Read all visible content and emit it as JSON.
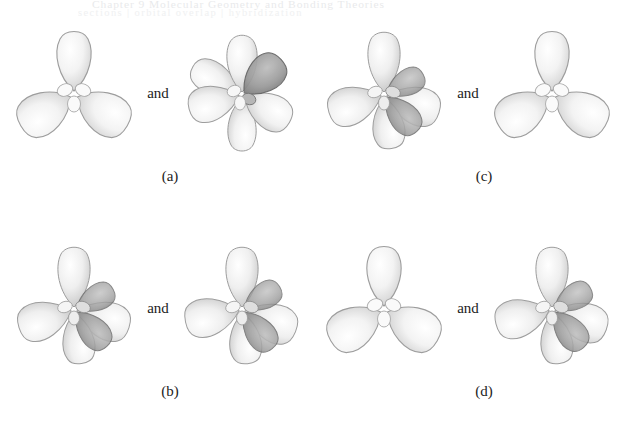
{
  "figure": {
    "background_color": "#ffffff",
    "ghost_header": {
      "line1": "Chapter 9   Molecular Geometry and Bonding Theories",
      "line2": "sections  |  orbital overlap  |  hybridization"
    },
    "conjunction_label": "and",
    "panels": [
      {
        "id": "a",
        "label": "(a)",
        "position": "top-left",
        "left": {
          "name": "three-lobe-orbital",
          "lobe_count": 3,
          "lobe_angles_deg": [
            90,
            210,
            330
          ],
          "shaded": false,
          "description": "three-lobed orbital, lobes up, lower-left, lower-right"
        },
        "right": {
          "name": "multi-lobe-orbital-shaded",
          "lobe_count": 6,
          "lobe_angles_deg": [
            90,
            150,
            210,
            270,
            330,
            45
          ],
          "shaded": true,
          "description": "six-lobed orbital with a dark shaded lobe pointing upper-right"
        }
      },
      {
        "id": "b",
        "label": "(b)",
        "position": "bottom-left",
        "left": {
          "name": "multi-lobe-orbital-shaded",
          "lobe_count": 6,
          "lobe_angles_deg": [
            90,
            150,
            210,
            270,
            330,
            30
          ],
          "shaded": true,
          "description": "six-lobed orbital with dark shaded lobes lower-right"
        },
        "right": {
          "name": "multi-lobe-orbital-shaded",
          "lobe_count": 6,
          "lobe_angles_deg": [
            90,
            150,
            210,
            270,
            330,
            30
          ],
          "shaded": true,
          "description": "six-lobed orbital with dark shaded lobes lower-right"
        }
      },
      {
        "id": "c",
        "label": "(c)",
        "position": "top-right",
        "left": {
          "name": "multi-lobe-orbital-shaded",
          "lobe_count": 6,
          "lobe_angles_deg": [
            90,
            150,
            210,
            270,
            330,
            30
          ],
          "shaded": true,
          "description": "six-lobed orbital with dark shaded lobes lower-right"
        },
        "right": {
          "name": "three-lobe-orbital",
          "lobe_count": 3,
          "lobe_angles_deg": [
            90,
            210,
            330
          ],
          "shaded": false,
          "description": "three-lobed orbital, lobes up, lower-left, lower-right"
        }
      },
      {
        "id": "d",
        "label": "(d)",
        "position": "bottom-right",
        "left": {
          "name": "three-lobe-orbital",
          "lobe_count": 3,
          "lobe_angles_deg": [
            90,
            210,
            330
          ],
          "shaded": false,
          "description": "three-lobed orbital, lobes up, lower-left, lower-right"
        },
        "right": {
          "name": "multi-lobe-orbital-shaded",
          "lobe_count": 6,
          "lobe_angles_deg": [
            90,
            150,
            210,
            270,
            330,
            30
          ],
          "shaded": true,
          "description": "six-lobed orbital with dark shaded lobes lower-right"
        }
      }
    ],
    "colors": {
      "lobe_light_fill": "#f2f2f2",
      "lobe_light_edge": "#9a9a9a",
      "lobe_dark_fill": "#9d9d9d",
      "lobe_dark_edge": "#5d5d5d",
      "label_text": "#1c1c1c",
      "ghost_text": "#dcdee0"
    }
  }
}
